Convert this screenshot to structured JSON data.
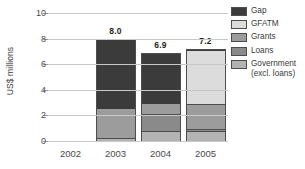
{
  "chart_data": {
    "type": "bar",
    "stacked": true,
    "title": "",
    "xlabel": "",
    "ylabel": "US$ millions",
    "ylim": [
      0,
      10
    ],
    "yticks": [
      0,
      2,
      4,
      6,
      8,
      10
    ],
    "ytick_labels": [
      "0",
      "2",
      "4",
      "6",
      "8",
      "10"
    ],
    "grid": "horizontal",
    "legend_position": "right",
    "categories": [
      "2002",
      "2003",
      "2004",
      "2005"
    ],
    "series": [
      {
        "name": "Government\n(excl. loans)",
        "color": "#b3b3b3",
        "values": [
          0,
          0.25,
          0.75,
          0.75
        ]
      },
      {
        "name": "Loans",
        "color": "#8a8a8a",
        "values": [
          0,
          0.0,
          1.35,
          0.15
        ]
      },
      {
        "name": "Grants",
        "color": "#9c9c9c",
        "values": [
          0,
          2.35,
          0.9,
          2.0
        ]
      },
      {
        "name": "GFATM",
        "color": "#dcdcdc",
        "values": [
          0,
          0.0,
          0.0,
          4.2
        ]
      },
      {
        "name": "Gap",
        "color": "#3b3b3b",
        "values": [
          0,
          5.4,
          3.9,
          0.1
        ]
      }
    ],
    "totals": [
      null,
      8.0,
      6.9,
      7.2
    ],
    "total_labels": [
      "",
      "8.0",
      "6.9",
      "7.2"
    ]
  },
  "legend": {
    "items": [
      {
        "label": "Gap",
        "color": "#3b3b3b"
      },
      {
        "label": "GFATM",
        "color": "#dcdcdc"
      },
      {
        "label": "Grants",
        "color": "#9c9c9c"
      },
      {
        "label": "Loans",
        "color": "#8a8a8a"
      },
      {
        "label": "Government\n(excl. loans)",
        "color": "#b3b3b3"
      }
    ]
  }
}
